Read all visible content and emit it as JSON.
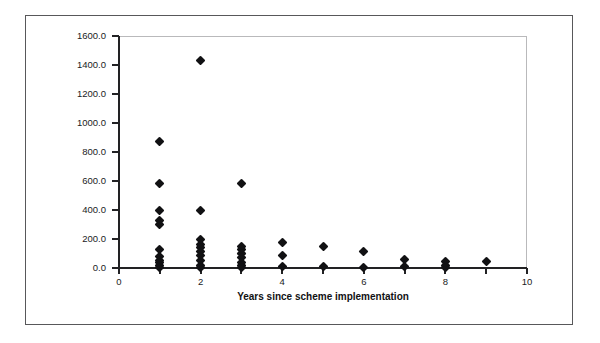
{
  "chart_data": {
    "type": "scatter",
    "title": "",
    "xlabel": "Years since scheme implementation",
    "ylabel": "",
    "xlim": [
      0,
      10
    ],
    "ylim": [
      0,
      1600
    ],
    "grid": false,
    "legend": "none",
    "marker": "filled-diamond",
    "marker_color": "#111113",
    "x_ticks": [
      0,
      2,
      4,
      6,
      8,
      10
    ],
    "x_tick_labels": [
      "0",
      "2",
      "4",
      "6",
      "8",
      "10"
    ],
    "x_minor_ticks": [
      1,
      3,
      5,
      7,
      9
    ],
    "y_ticks": [
      0,
      200,
      400,
      600,
      800,
      1000,
      1200,
      1400,
      1600
    ],
    "y_tick_labels": [
      "0.0",
      "200.0",
      "400.0",
      "600.0",
      "800.0",
      "1000.0",
      "1200.0",
      "1400.0",
      "1600.0"
    ],
    "points": [
      {
        "x": 1,
        "y": 870
      },
      {
        "x": 1,
        "y": 580
      },
      {
        "x": 1,
        "y": 400
      },
      {
        "x": 1,
        "y": 330
      },
      {
        "x": 1,
        "y": 300
      },
      {
        "x": 1,
        "y": 130
      },
      {
        "x": 1,
        "y": 80
      },
      {
        "x": 1,
        "y": 55
      },
      {
        "x": 1,
        "y": 35
      },
      {
        "x": 1,
        "y": 18
      },
      {
        "x": 1,
        "y": 5
      },
      {
        "x": 2,
        "y": 1430
      },
      {
        "x": 2,
        "y": 400
      },
      {
        "x": 2,
        "y": 195
      },
      {
        "x": 2,
        "y": 165
      },
      {
        "x": 2,
        "y": 140
      },
      {
        "x": 2,
        "y": 115
      },
      {
        "x": 2,
        "y": 85
      },
      {
        "x": 2,
        "y": 50
      },
      {
        "x": 2,
        "y": 20
      },
      {
        "x": 2,
        "y": 5
      },
      {
        "x": 3,
        "y": 580
      },
      {
        "x": 3,
        "y": 150
      },
      {
        "x": 3,
        "y": 125
      },
      {
        "x": 3,
        "y": 100
      },
      {
        "x": 3,
        "y": 70
      },
      {
        "x": 3,
        "y": 40
      },
      {
        "x": 3,
        "y": 15
      },
      {
        "x": 3,
        "y": 5
      },
      {
        "x": 4,
        "y": 175
      },
      {
        "x": 4,
        "y": 85
      },
      {
        "x": 4,
        "y": 10
      },
      {
        "x": 5,
        "y": 145
      },
      {
        "x": 5,
        "y": 10
      },
      {
        "x": 6,
        "y": 115
      },
      {
        "x": 6,
        "y": 5
      },
      {
        "x": 7,
        "y": 60
      },
      {
        "x": 7,
        "y": 10
      },
      {
        "x": 8,
        "y": 45
      },
      {
        "x": 8,
        "y": 20
      },
      {
        "x": 8,
        "y": 5
      },
      {
        "x": 9,
        "y": 45
      }
    ]
  }
}
